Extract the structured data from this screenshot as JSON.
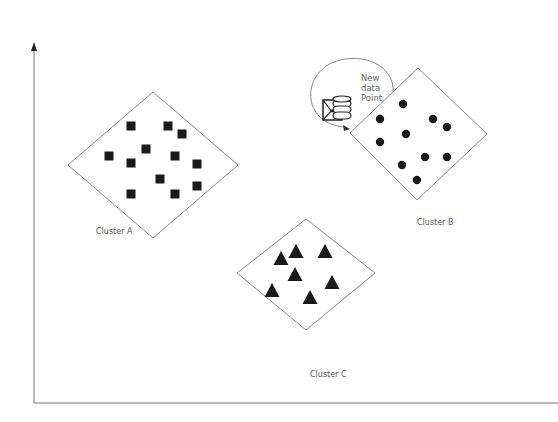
{
  "diagram": {
    "title": "",
    "axes": {
      "x_axis": {
        "from": [
          34,
          403
        ],
        "to": [
          558,
          403
        ]
      },
      "y_axis": {
        "from": [
          34,
          403
        ],
        "to": [
          34,
          44
        ]
      },
      "y_arrow": true
    },
    "clusters": [
      {
        "id": "A",
        "label": "Cluster A",
        "marker": "square",
        "diamond": [
          [
            153,
            92
          ],
          [
            238,
            165
          ],
          [
            153,
            238
          ],
          [
            68,
            165
          ]
        ],
        "label_pos": [
          96,
          227
        ],
        "points": [
          [
            131,
            126
          ],
          [
            168,
            126
          ],
          [
            182,
            134
          ],
          [
            146,
            149
          ],
          [
            109,
            156
          ],
          [
            131,
            163
          ],
          [
            175,
            156
          ],
          [
            197,
            164
          ],
          [
            160,
            179
          ],
          [
            197,
            186
          ],
          [
            131,
            194
          ],
          [
            175,
            194
          ]
        ]
      },
      {
        "id": "B",
        "label": "Cluster B",
        "marker": "circle",
        "diamond": [
          [
            418,
            68
          ],
          [
            487,
            134
          ],
          [
            417,
            200
          ],
          [
            350,
            133
          ]
        ],
        "label_pos": [
          417,
          218
        ],
        "points": [
          [
            403,
            104
          ],
          [
            380,
            119
          ],
          [
            433,
            119
          ],
          [
            447,
            127
          ],
          [
            406,
            134
          ],
          [
            380,
            142
          ],
          [
            425,
            157
          ],
          [
            447,
            157
          ],
          [
            402,
            165
          ],
          [
            417,
            180
          ]
        ]
      },
      {
        "id": "C",
        "label": "Cluster C",
        "marker": "triangle",
        "diamond": [
          [
            306,
            219
          ],
          [
            375,
            273
          ],
          [
            306,
            330
          ],
          [
            237,
            273
          ]
        ],
        "label_pos": [
          310,
          370
        ],
        "points": [
          [
            281,
            259
          ],
          [
            296,
            252
          ],
          [
            325,
            252
          ],
          [
            295,
            275
          ],
          [
            272,
            291
          ],
          [
            332,
            283
          ],
          [
            310,
            298
          ]
        ]
      }
    ],
    "new_point": {
      "label_lines": [
        "New",
        "data",
        "Point"
      ],
      "icon": "database-envelope-icon"
    },
    "colors": {
      "marker": "#1a1a1a",
      "line": "#8a8a8a",
      "text": "#555555"
    }
  }
}
